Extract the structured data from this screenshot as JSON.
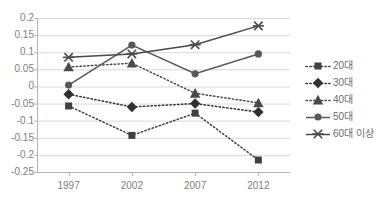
{
  "top_sliver_text": "",
  "chart_data": {
    "type": "line",
    "title": "",
    "subtitle": "",
    "xlabel": "",
    "ylabel": "",
    "categories": [
      "1997",
      "2002",
      "2007",
      "2012"
    ],
    "ylim": [
      -0.25,
      0.2
    ],
    "yticks": [
      "0.2",
      "0.15",
      "0.1",
      "0.05",
      "0",
      "-0.05",
      "-0.1",
      "-0.15",
      "-0.2",
      "-0.25"
    ],
    "ytick_values": [
      0.2,
      0.15,
      0.1,
      0.05,
      0,
      -0.05,
      -0.1,
      -0.15,
      -0.2,
      -0.25
    ],
    "grid": "horizontal",
    "legend_position": "right",
    "series": [
      {
        "name": "20대",
        "marker": "square",
        "line_style": "dotted",
        "color": "#404040",
        "values": [
          -0.057,
          -0.143,
          -0.078,
          -0.215
        ]
      },
      {
        "name": "30대",
        "marker": "diamond",
        "line_style": "dotted",
        "color": "#303030",
        "values": [
          -0.023,
          -0.06,
          -0.05,
          -0.075
        ]
      },
      {
        "name": "40대",
        "marker": "triangle",
        "line_style": "dotted",
        "color": "#4a4a4a",
        "values": [
          0.057,
          0.068,
          -0.02,
          -0.048
        ]
      },
      {
        "name": "50대",
        "marker": "circle",
        "line_style": "solid",
        "color": "#585858",
        "values": [
          0.004,
          0.121,
          0.037,
          0.095
        ]
      },
      {
        "name": "60대 이상",
        "marker": "x",
        "line_style": "solid",
        "color": "#4a4a4a",
        "values": [
          0.085,
          0.095,
          0.122,
          0.177
        ]
      }
    ]
  },
  "axis": {
    "grid_color": "#d9d9d9",
    "axis_color": "#b5b5b5",
    "tick_text_color": "#808080"
  }
}
